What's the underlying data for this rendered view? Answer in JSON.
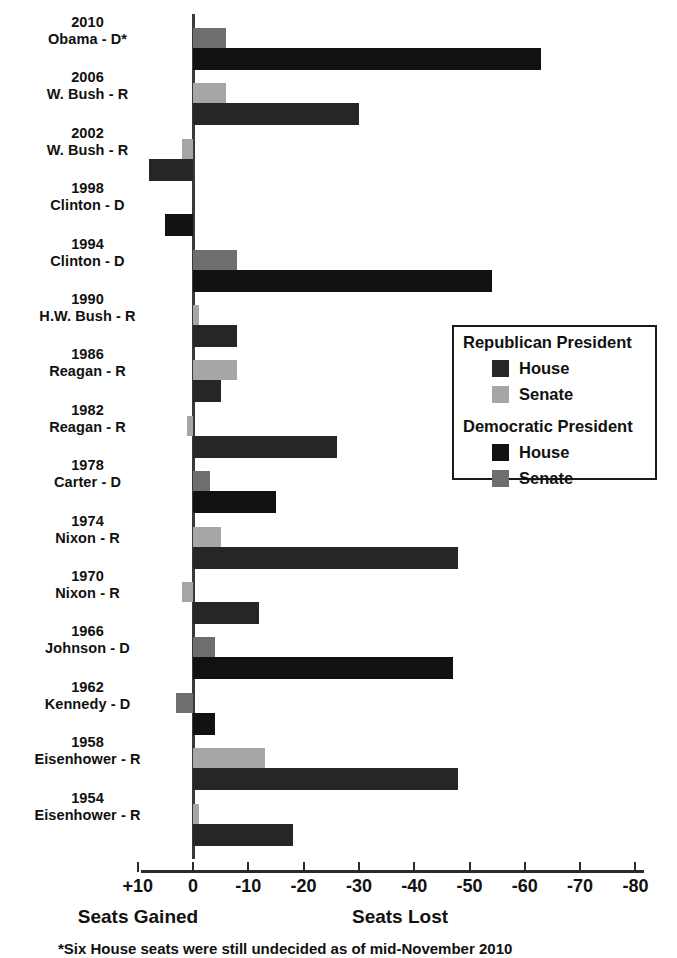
{
  "chart_data": {
    "type": "bar",
    "orientation": "horizontal",
    "title": "",
    "xlabel_left": "Seats Gained",
    "xlabel_right": "Seats Lost",
    "grid": false,
    "xlim": [
      10,
      -80
    ],
    "xticks": [
      "+10",
      "0",
      "-10",
      "-20",
      "-30",
      "-40",
      "-50",
      "-60",
      "-70",
      "-80"
    ],
    "xtick_values": [
      10,
      0,
      -10,
      -20,
      -30,
      -40,
      -50,
      -60,
      -70,
      -80
    ],
    "legend_position": "middle-right",
    "footnote": "*Six House seats were still undecided as of mid-November 2010",
    "series": [
      {
        "name": "House",
        "key": "house"
      },
      {
        "name": "Senate",
        "key": "senate"
      }
    ],
    "categories": [
      "2010 Obama - D*",
      "2006 W. Bush - R",
      "2002 W. Bush - R",
      "1998 Clinton - D",
      "1994 Clinton - D",
      "1990 H.W. Bush - R",
      "1986 Reagan - R",
      "1982 Reagan - R",
      "1978 Carter - D",
      "1974 Nixon - R",
      "1970 Nixon - R",
      "1966 Johnson - D",
      "1962 Kennedy - D",
      "1958 Eisenhower - R",
      "1954 Eisenhower - R"
    ],
    "rows": [
      {
        "year": "2010",
        "president": "Obama - D*",
        "party": "D",
        "house": -63,
        "senate": -6
      },
      {
        "year": "2006",
        "president": "W. Bush - R",
        "party": "R",
        "house": -30,
        "senate": -6
      },
      {
        "year": "2002",
        "president": "W. Bush - R",
        "party": "R",
        "house": 8,
        "senate": 2
      },
      {
        "year": "1998",
        "president": "Clinton - D",
        "party": "D",
        "house": 5,
        "senate": 0
      },
      {
        "year": "1994",
        "president": "Clinton - D",
        "party": "D",
        "house": -54,
        "senate": -8
      },
      {
        "year": "1990",
        "president": "H.W. Bush - R",
        "party": "R",
        "house": -8,
        "senate": -1
      },
      {
        "year": "1986",
        "president": "Reagan - R",
        "party": "R",
        "house": -5,
        "senate": -8
      },
      {
        "year": "1982",
        "president": "Reagan - R",
        "party": "R",
        "house": -26,
        "senate": 1
      },
      {
        "year": "1978",
        "president": "Carter - D",
        "party": "D",
        "house": -15,
        "senate": -3
      },
      {
        "year": "1974",
        "president": "Nixon - R",
        "party": "R",
        "house": -48,
        "senate": -5
      },
      {
        "year": "1970",
        "president": "Nixon - R",
        "party": "R",
        "house": -12,
        "senate": 2
      },
      {
        "year": "1966",
        "president": "Johnson - D",
        "party": "D",
        "house": -47,
        "senate": -4
      },
      {
        "year": "1962",
        "president": "Kennedy - D",
        "party": "D",
        "house": -4,
        "senate": 3
      },
      {
        "year": "1958",
        "president": "Eisenhower - R",
        "party": "R",
        "house": -48,
        "senate": -13
      },
      {
        "year": "1954",
        "president": "Eisenhower - R",
        "party": "R",
        "house": -18,
        "senate": -1
      }
    ]
  },
  "legend": {
    "republican_title": "Republican President",
    "democratic_title": "Democratic President",
    "republican_house_label": "House",
    "republican_senate_label": "Senate",
    "democratic_house_label": "House",
    "democratic_senate_label": "Senate"
  },
  "colors": {
    "republican_house": "#262626",
    "republican_senate": "#a6a6a6",
    "democratic_house": "#111111",
    "democratic_senate": "#6e6e6e",
    "axis": "#2b2b2b",
    "text": "#111111",
    "background": "#ffffff"
  }
}
